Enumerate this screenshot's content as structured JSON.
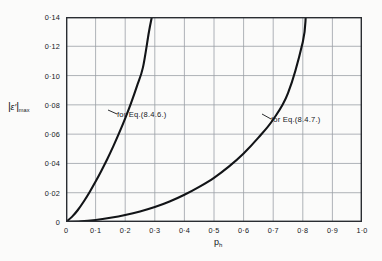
{
  "chart_data": {
    "type": "line",
    "title": "",
    "xlabel": "p_h",
    "ylabel": "|e'|max",
    "xlim": [
      0,
      1.0
    ],
    "ylim": [
      0,
      0.14
    ],
    "grid": true,
    "legend_position": "inline-annotations",
    "x_ticks": [
      "0",
      "0·1",
      "0·2",
      "0·3",
      "0·4",
      "0·5",
      "0·6",
      "0·7",
      "0·8",
      "0·9",
      "1·0"
    ],
    "x_tick_values": [
      0,
      0.1,
      0.2,
      0.3,
      0.4,
      0.5,
      0.6,
      0.7,
      0.8,
      0.9,
      1.0
    ],
    "y_ticks": [
      "0",
      "0·02",
      "0·04",
      "0·06",
      "0·08",
      "0·10",
      "0·12",
      "0·14"
    ],
    "y_tick_values": [
      0,
      0.02,
      0.04,
      0.06,
      0.08,
      0.1,
      0.12,
      0.14
    ],
    "series": [
      {
        "name": "for Eq.(8.4.6.)",
        "x": [
          0.0,
          0.02,
          0.04,
          0.06,
          0.08,
          0.1,
          0.12,
          0.14,
          0.16,
          0.18,
          0.2,
          0.22,
          0.24,
          0.26,
          0.28,
          0.29
        ],
        "values": [
          0.0,
          0.0035,
          0.0082,
          0.014,
          0.0205,
          0.0276,
          0.0352,
          0.0432,
          0.0518,
          0.061,
          0.0708,
          0.0814,
          0.093,
          0.1056,
          0.1296,
          0.14
        ]
      },
      {
        "name": "for Eq.(8.4.7.)",
        "x": [
          0.0,
          0.05,
          0.1,
          0.15,
          0.2,
          0.25,
          0.3,
          0.35,
          0.4,
          0.45,
          0.5,
          0.55,
          0.6,
          0.65,
          0.7,
          0.75,
          0.8,
          0.81
        ],
        "values": [
          0.0,
          0.0004,
          0.0014,
          0.0029,
          0.0048,
          0.0072,
          0.0102,
          0.014,
          0.0186,
          0.024,
          0.0302,
          0.0378,
          0.0468,
          0.0576,
          0.07,
          0.088,
          0.123,
          0.14
        ]
      }
    ],
    "annotations": [
      {
        "text": "for  Eq.(8.4.6.)"
      },
      {
        "text": "for  Eq.(8.4.7.)"
      }
    ]
  },
  "colors": {
    "axis": "#2a2d32",
    "grid": "#9aa0a6",
    "curve": "#121417",
    "background": "#fbfbfa"
  }
}
